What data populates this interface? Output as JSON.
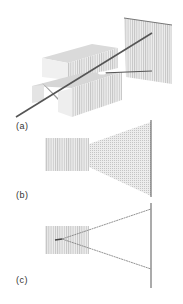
{
  "figure": {
    "panels": [
      {
        "id": "a",
        "label": "(a)",
        "description": "3D view: beam passing through a slit between two blocks onto a screen"
      },
      {
        "id": "b",
        "label": "(b)",
        "description": "Wave field passing a narrow opening, spreading to screen"
      },
      {
        "id": "c",
        "label": "(c)",
        "description": "Two diverging ray lines from a point to the screen"
      }
    ]
  },
  "colors": {
    "block_light": "#e6e6e6",
    "block_mid": "#cfcfcf",
    "block_dark": "#b5b5b5",
    "beam": "#555555",
    "hatch": "#c8c8c8",
    "screen_line": "#666666",
    "ray_line": "#777777"
  }
}
